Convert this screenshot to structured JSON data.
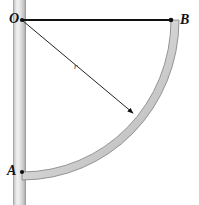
{
  "figure": {
    "caption": "",
    "labels": {
      "origin": "O",
      "top_right": "B",
      "bottom_left": "A",
      "radius": "r"
    },
    "colors": {
      "line": "#111111",
      "band_fill": "#c9c9c9",
      "band_edge": "#8a8a8a",
      "post_light": "#f0f0f0",
      "post_mid": "#d8d8d8",
      "post_edge": "#9a9a9a",
      "background": "#ffffff"
    },
    "geometry": {
      "center_x": 22,
      "center_y": 20,
      "radius": 150,
      "arc_start_deg": 0,
      "arc_end_deg": 90,
      "band_thickness": 8,
      "point_O": [
        22,
        20
      ],
      "point_B": [
        171,
        20
      ],
      "point_A": [
        22,
        172
      ],
      "radius_arrow_tip": [
        133,
        113
      ],
      "post_x_left": 13,
      "post_x_right": 26
    }
  }
}
